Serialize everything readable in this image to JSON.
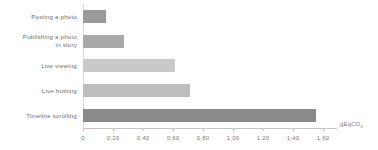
{
  "chart_data": {
    "type": "bar",
    "orientation": "horizontal",
    "title": "",
    "subtitle": "",
    "xlabel": "gEqCO2",
    "ylabel": "",
    "categories": [
      "Posting a photo",
      "Publishing a photo\nin story",
      "Live viewing",
      "Live hosting",
      "Timeline scrolling"
    ],
    "values": [
      0.15,
      0.27,
      0.61,
      0.71,
      1.55
    ],
    "xlim": [
      0,
      1.6
    ],
    "xticks": [
      0,
      0.2,
      0.4,
      0.6,
      0.8,
      1.0,
      1.2,
      1.4,
      1.6
    ],
    "xtick_labels": [
      "0",
      "0,20",
      "0,40",
      "0,60",
      "0,80",
      "1,00",
      "1,20",
      "1,40",
      "1,60"
    ],
    "grid": false,
    "legend": null,
    "bar_colors": [
      "#9a9a9a",
      "#a9a9a9",
      "#c9c9c9",
      "#bdbdbd",
      "#8a8a8a"
    ]
  },
  "axis": {
    "unit_main": "gEqCO",
    "unit_sub": "2"
  }
}
